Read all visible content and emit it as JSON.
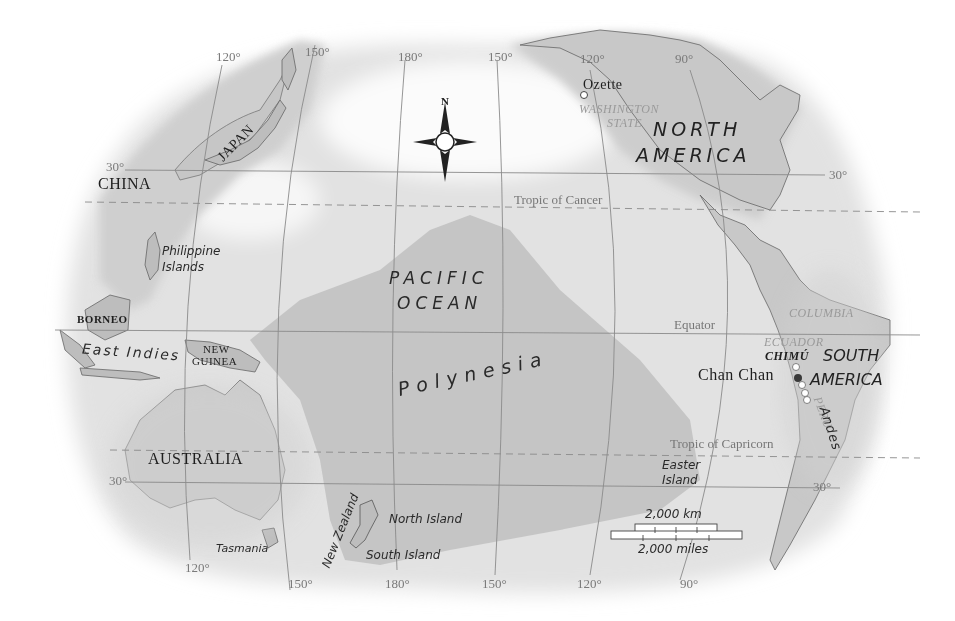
{
  "map": {
    "title": "Pacific Ocean and Polynesia",
    "compass": {
      "north_label": "N"
    },
    "oceans": [
      {
        "id": "pacific-ocean",
        "line1": "PACIFIC",
        "line2": "OCEAN"
      }
    ],
    "regions": {
      "polynesia": "Polynesia",
      "east_indies": "East Indies",
      "andes": "Andes"
    },
    "continents": {
      "north_america": {
        "line1": "NORTH",
        "line2": "AMERICA"
      },
      "south_america": {
        "line1": "SOUTH",
        "line2": "AMERICA"
      },
      "australia": "AUSTRALIA"
    },
    "countries": {
      "china": "CHINA",
      "japan": "JAPAN",
      "borneo": "BORNEO",
      "new_guinea": {
        "line1": "NEW",
        "line2": "GUINEA"
      },
      "columbia": "COLUMBIA",
      "ecuador": "ECUADOR",
      "peru": "PERU",
      "washington_state": {
        "line1": "WASHINGTON",
        "line2": "STATE"
      },
      "chimu": "CHIMÚ"
    },
    "islands": {
      "philippine": {
        "line1": "Philippine",
        "line2": "Islands"
      },
      "tasmania": "Tasmania",
      "new_zealand": "New Zealand",
      "north_island": "North Island",
      "south_island": "South Island",
      "easter": {
        "line1": "Easter",
        "line2": "Island"
      }
    },
    "sites": {
      "ozette": "Ozette",
      "chan_chan": "Chan Chan"
    },
    "lines": {
      "tropic_of_cancer": "Tropic of Cancer",
      "equator": "Equator",
      "tropic_of_capricorn": "Tropic of Capricorn"
    },
    "degree_labels": {
      "top_120w_asia": "120°",
      "top_150": "150°",
      "top_180": "180°",
      "top_150w": "150°",
      "top_120w": "120°",
      "top_90w": "90°",
      "lat_30n_left": "30°",
      "lat_30n_right": "30°",
      "lat_30s_left": "30°",
      "lat_30s_right": "30°",
      "bot_120": "120°",
      "bot_150": "150°",
      "bot_180": "180°",
      "bot_150w": "150°",
      "bot_120w": "120°",
      "bot_90w": "90°"
    },
    "scale_bar": {
      "km_label": "2,000 km",
      "miles_label": "2,000 miles"
    },
    "colors": {
      "land": "#c9c9c9",
      "polynesia_fill": "#c4c4c4",
      "ocean_near": "#dcdcdc",
      "grid_line": "#8a8a8a",
      "text_dark": "#1e1e1e",
      "chan_chan_dot": "#3a3a3a"
    }
  }
}
